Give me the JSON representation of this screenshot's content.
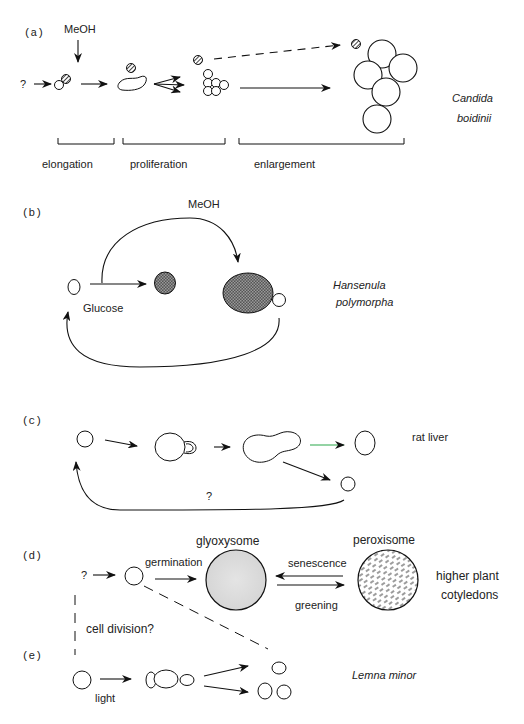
{
  "panels": {
    "a": {
      "label": "(a)",
      "input": "MeOH",
      "origin": "?",
      "stages": [
        "elongation",
        "proliferation",
        "enlargement"
      ],
      "organism_line1": "Candida",
      "organism_line2": "boidinii"
    },
    "b": {
      "label": "(b)",
      "input": "MeOH",
      "condition": "Glucose",
      "organism_line1": "Hansenula",
      "organism_line2": "polymorpha"
    },
    "c": {
      "label": "(c)",
      "return_label": "?",
      "organism": "rat liver"
    },
    "d": {
      "label": "(d)",
      "origin": "?",
      "step1": "germination",
      "organelle1": "glyoxysome",
      "organelle2": "peroxisome",
      "forward": "greening",
      "reverse": "senescence",
      "organism_line1": "higher plant",
      "organism_line2": "cotyledons",
      "link_label": "cell division?"
    },
    "e": {
      "label": "(e)",
      "condition": "light",
      "organism": "Lemna minor"
    }
  }
}
